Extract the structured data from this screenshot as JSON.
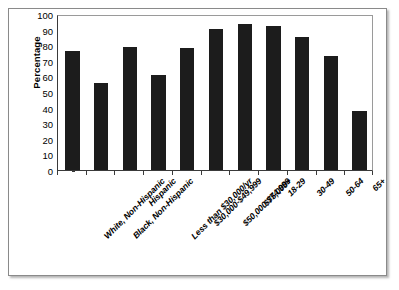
{
  "chart_data": {
    "type": "bar",
    "title": "",
    "xlabel": "",
    "ylabel": "Percentage",
    "ylim": [
      0,
      100
    ],
    "yticks": [
      0,
      10,
      20,
      30,
      40,
      50,
      60,
      70,
      80,
      90,
      100
    ],
    "grid": false,
    "legend": false,
    "bar_color": "#1c1c1c",
    "categories": [
      "White, Non-Hispanic",
      "Black, Non-Hispanic",
      "Hispanic",
      "Less than $30,000/yr",
      "$30,000-$49,999",
      "$50,000-$74,999",
      "$75,000+",
      "18-29",
      "30-49",
      "50-64",
      "65+"
    ],
    "values": [
      76,
      56,
      79,
      61,
      78,
      90.5,
      93.5,
      92,
      85.5,
      73,
      38
    ]
  }
}
